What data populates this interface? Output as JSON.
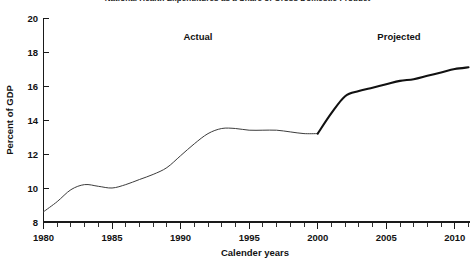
{
  "figure": {
    "clipped_top_title": "National Health Expenditures as a Share of Gross Domestic Product",
    "background_color": "#ffffff"
  },
  "annotations": {
    "actual_label": "Actual",
    "projected_label": "Projected"
  },
  "axes": {
    "y_title": "Percent of GDP",
    "x_title": "Calender years",
    "y_ticklabels": [
      "8",
      "10",
      "12",
      "14",
      "16",
      "18",
      "20"
    ],
    "x_ticklabels": [
      "1980",
      "1985",
      "1990",
      "1995",
      "2000",
      "2005",
      "2010"
    ]
  },
  "chart_data": {
    "type": "line",
    "title": "National Health Expenditures as a Share of Gross Domestic Product",
    "xlabel": "Calender years",
    "ylabel": "Percent of GDP",
    "xlim": [
      1980,
      2011
    ],
    "ylim": [
      8,
      20
    ],
    "yticks": [
      8,
      10,
      12,
      14,
      16,
      18,
      20
    ],
    "xticks": [
      1980,
      1985,
      1990,
      1995,
      2000,
      2005,
      2010
    ],
    "x_minor_tick_step": 1,
    "grid": false,
    "legend": "none",
    "annotations": [
      {
        "text": "Actual",
        "x": 1990.5,
        "y": 19.0
      },
      {
        "text": "Projected",
        "x": 2005.8,
        "y": 19.0
      }
    ],
    "series": [
      {
        "name": "Actual",
        "style": "thin",
        "color": "#3c3c3c",
        "x": [
          1980,
          1981,
          1982,
          1983,
          1984,
          1985,
          1986,
          1987,
          1988,
          1989,
          1990,
          1991,
          1992,
          1993,
          1994,
          1995,
          1996,
          1997,
          1998,
          1999,
          2000
        ],
        "values": [
          8.6,
          9.2,
          9.9,
          10.2,
          10.1,
          10.0,
          10.2,
          10.5,
          10.8,
          11.2,
          11.9,
          12.6,
          13.2,
          13.5,
          13.5,
          13.4,
          13.4,
          13.4,
          13.3,
          13.2,
          13.2
        ]
      },
      {
        "name": "Projected",
        "style": "thick",
        "color": "#111111",
        "x": [
          2000,
          2001,
          2002,
          2003,
          2004,
          2005,
          2006,
          2007,
          2008,
          2009,
          2010,
          2011
        ],
        "values": [
          13.2,
          14.4,
          15.4,
          15.7,
          15.9,
          16.1,
          16.3,
          16.4,
          16.6,
          16.8,
          17.0,
          17.1
        ]
      }
    ]
  }
}
